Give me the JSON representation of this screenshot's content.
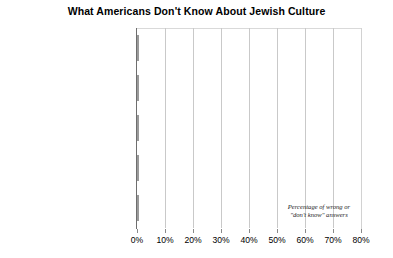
{
  "chart_data": {
    "type": "bar",
    "orientation": "horizontal",
    "title": "What Americans Don't Know About Jewish Culture",
    "xlabel": "",
    "ylabel": "",
    "xlim": [
      0,
      80
    ],
    "xticks": [
      "0%",
      "10%",
      "20%",
      "30%",
      "40%",
      "50%",
      "60%",
      "70%",
      "80%"
    ],
    "xtick_values": [
      0,
      10,
      20,
      30,
      40,
      50,
      60,
      70,
      80
    ],
    "grid": true,
    "legend": "none",
    "categories": [
      "The number of candles on a menorah",
      "When the High Holidays are",
      "The day of the week the Sabbath begins",
      "That shrimp isn't kosher",
      "That Jesus was Jewish"
    ],
    "category_lines": [
      [
        "The number of candles",
        "on a menorah"
      ],
      [
        "When the High Holidays are"
      ],
      [
        "The day of the week the",
        "Sabbath begins"
      ],
      [
        "That shrimp isn't kosher"
      ],
      [
        "That Jesus was Jewish"
      ]
    ],
    "values": [
      71,
      63,
      60,
      50,
      21
    ],
    "annotation": [
      "Percentage of wrong or",
      "\"don't know\" answers"
    ],
    "bar_color": "#a9a9a9",
    "grid_color": "#c9c9c9",
    "axis_color": "#6e6e6e",
    "text_color": "#000000"
  }
}
